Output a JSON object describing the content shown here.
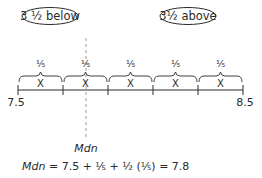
{
  "diagram": {
    "ovals": [
      {
        "label": "3 ½ below",
        "cx": 50
      },
      {
        "label": "3½ above",
        "cx": 188
      }
    ],
    "segments": [
      {
        "fraction": "⅕",
        "label": "X"
      },
      {
        "fraction": "⅕",
        "label": "X"
      },
      {
        "fraction": "⅕",
        "label": "X"
      },
      {
        "fraction": "⅕",
        "label": "X"
      },
      {
        "fraction": "⅕",
        "label": "X"
      }
    ],
    "axis": {
      "start_label": "7.5",
      "end_label": "8.5",
      "ticks_x": [
        18,
        63,
        108,
        153,
        198,
        243
      ]
    },
    "median": {
      "label": "Mdn",
      "x": 86
    },
    "formula": {
      "lhs": "Mdn",
      "rhs": " = 7.5 + ⅕ + ½ (⅕) = 7.8"
    }
  }
}
